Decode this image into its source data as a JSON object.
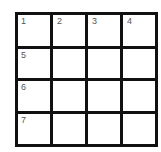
{
  "grid": {
    "rows": 4,
    "cols": 4,
    "cells": [
      [
        "1",
        "2",
        "3",
        "4"
      ],
      [
        "5",
        "",
        "",
        ""
      ],
      [
        "6",
        "",
        "",
        ""
      ],
      [
        "7",
        "",
        "",
        ""
      ]
    ],
    "border_color": "#111111",
    "number_color": "#555555"
  }
}
